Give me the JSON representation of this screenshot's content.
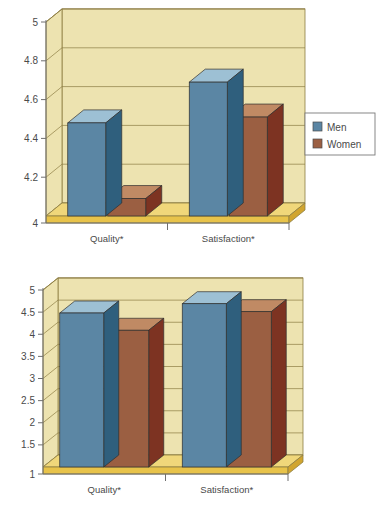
{
  "figure": {
    "copyright": "© 2016 Cengage Learning®"
  },
  "palette": {
    "men_front": "#5b86a4",
    "men_top": "#9dc0d4",
    "men_side": "#2f5f7d",
    "women_front": "#9b5f42",
    "women_top": "#c08a64",
    "women_side": "#7d3322",
    "plot_bg": "#ede3b0",
    "plot_back_wall": "#e7dca3",
    "floor": "#e8c34a",
    "floor_top": "#f0d77a",
    "grid": "#8d7d43",
    "axis": "#6f6f6f",
    "legend_border": "#7a7a7a",
    "label_color": "#4a4a4a"
  },
  "legend": {
    "position": "right",
    "entries": [
      {
        "label": "Men",
        "color": "#5b86a4"
      },
      {
        "label": "Women",
        "color": "#9b5f42"
      }
    ]
  },
  "chart_data": [
    {
      "id": "top",
      "type": "bar",
      "title": "",
      "subtitle": "",
      "xlabel": "",
      "ylabel": "",
      "categories": [
        "Quality*",
        "Satisfaction*"
      ],
      "series": [
        {
          "name": "Men",
          "values": [
            4.48,
            4.69
          ]
        },
        {
          "name": "Women",
          "values": [
            4.09,
            4.51
          ]
        }
      ],
      "ylim": [
        4,
        5
      ],
      "yticks": [
        4,
        4.2,
        4.4,
        4.6,
        4.8,
        5
      ],
      "ytick_labels": [
        "4",
        "4.2",
        "4.4",
        "4.6",
        "4.8",
        "5"
      ],
      "grid": true,
      "legend": [
        "Men",
        "Women"
      ],
      "legend_position": "right",
      "style": "3d-column"
    },
    {
      "id": "bottom",
      "type": "bar",
      "title": "",
      "subtitle": "",
      "xlabel": "",
      "ylabel": "",
      "categories": [
        "Quality*",
        "Satisfaction*"
      ],
      "series": [
        {
          "name": "Men",
          "values": [
            4.48,
            4.69
          ]
        },
        {
          "name": "Women",
          "values": [
            4.09,
            4.51
          ]
        }
      ],
      "ylim": [
        1,
        5
      ],
      "yticks": [
        1,
        1.5,
        2,
        2.5,
        3,
        3.5,
        4,
        4.5,
        5
      ],
      "ytick_labels": [
        "1",
        "1.5",
        "2",
        "2.5",
        "3",
        "3.5",
        "4",
        "4.5",
        "5"
      ],
      "grid": true,
      "legend": [
        "Men",
        "Women"
      ],
      "legend_position": "right",
      "style": "3d-column"
    }
  ]
}
